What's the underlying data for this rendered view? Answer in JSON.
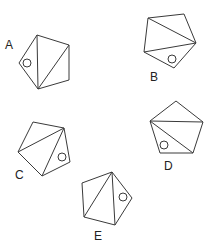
{
  "figures": [
    {
      "label": "A",
      "diagonals": "two diagonals from bottom vertex",
      "circle_region": "left triangle"
    },
    {
      "label": "B",
      "diagonals": "two diagonals from right vertex",
      "circle_region": "bottom triangle"
    },
    {
      "label": "C",
      "diagonals": "two diagonals from top-right vertex",
      "circle_region": "right triangle"
    },
    {
      "label": "D",
      "diagonals": "two diagonals from left vertex",
      "circle_region": "bottom-left triangle"
    },
    {
      "label": "E",
      "diagonals": "two diagonals from top vertex",
      "circle_region": "right triangle"
    }
  ],
  "colors": {
    "line": "#3a3a3a",
    "text": "#222222",
    "background": "#ffffff"
  }
}
